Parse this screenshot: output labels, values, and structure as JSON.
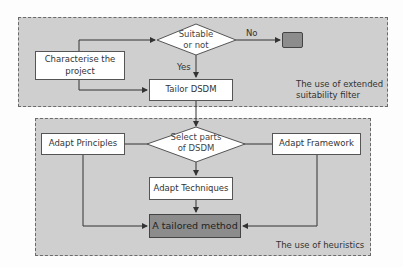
{
  "diagram": {
    "top_panel": {
      "caption_line1": "The use of extended",
      "caption_line2": "suitability filter"
    },
    "bottom_panel": {
      "caption": "The use of heuristics"
    },
    "nodes": {
      "characterise": {
        "line1": "Characterise the",
        "line2": "project"
      },
      "suitable": {
        "line1": "Suitable",
        "line2": "or not"
      },
      "reject": {
        "label": ""
      },
      "tailor": {
        "label": "Tailor DSDM"
      },
      "select": {
        "line1": "Select parts",
        "line2": "of DSDM"
      },
      "principles": {
        "label": "Adapt Principles"
      },
      "framework": {
        "label": "Adapt Framework"
      },
      "techniques": {
        "label": "Adapt Techniques"
      },
      "result": {
        "label": "A tailored method"
      }
    },
    "edge_labels": {
      "no": "No",
      "yes": "Yes"
    },
    "colors": {
      "panel_fill": "#cfcfcf",
      "node_fill": "#ffffff",
      "terminal_fill": "#8c8c8c",
      "line": "#333333"
    }
  }
}
